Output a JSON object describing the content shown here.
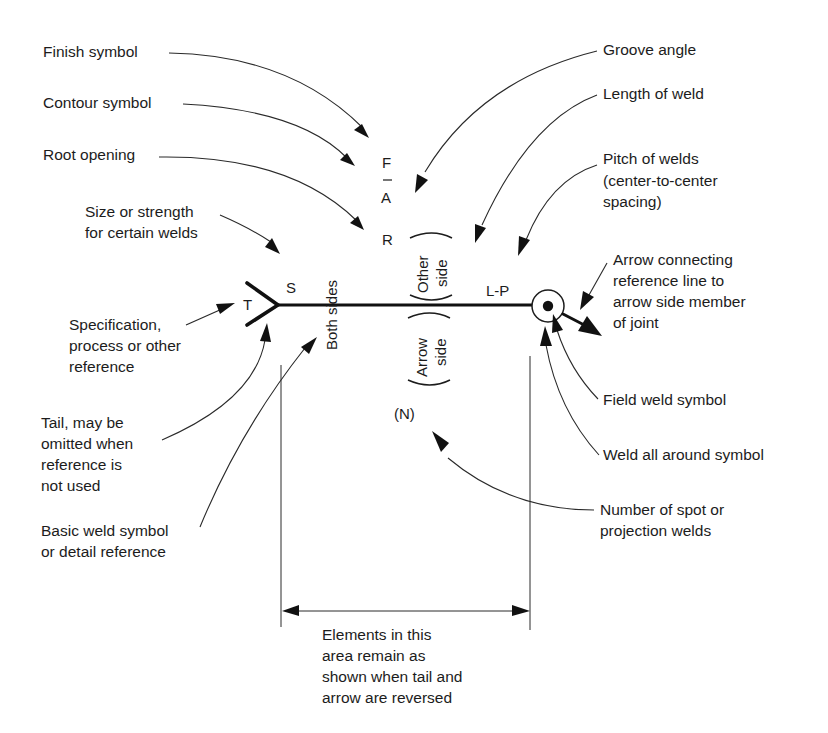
{
  "diagram": {
    "callouts": {
      "finish_symbol": [
        "Finish symbol"
      ],
      "contour_symbol": [
        "Contour symbol"
      ],
      "root_opening": [
        "Root opening"
      ],
      "size_strength": [
        "Size or strength",
        "for certain welds"
      ],
      "specification": [
        "Specification,",
        "process or other",
        "reference"
      ],
      "tail": [
        "Tail, may be",
        "omitted when",
        "reference is",
        "not used"
      ],
      "basic_weld": [
        "Basic weld symbol",
        "or detail reference"
      ],
      "groove_angle": [
        "Groove angle"
      ],
      "length_of_weld": [
        "Length of weld"
      ],
      "pitch": [
        "Pitch of welds",
        "(center-to-center",
        "spacing)"
      ],
      "arrow_connecting": [
        "Arrow connecting",
        "reference line to",
        "arrow side member",
        "of joint"
      ],
      "field_weld": [
        "Field weld symbol"
      ],
      "weld_all_around": [
        "Weld all around symbol"
      ],
      "spot_welds": [
        "Number of spot or",
        "projection welds"
      ],
      "elements_area": [
        "Elements in this",
        "area remain as",
        "shown when tail and",
        "arrow are reversed"
      ]
    },
    "symbols": {
      "F": "F",
      "A": "A",
      "R": "R",
      "S": "S",
      "T": "T",
      "LP": "L-P",
      "N": "(N)",
      "both_sides": "Both sides",
      "other_side": [
        "Other",
        "side"
      ],
      "arrow_side": [
        "Arrow",
        "side"
      ]
    }
  }
}
